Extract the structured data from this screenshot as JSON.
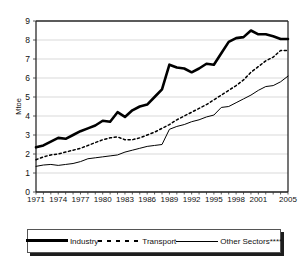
{
  "chart_data": {
    "type": "line",
    "title": "",
    "xlabel": "",
    "ylabel": "Mtoe",
    "ylim": [
      0,
      9
    ],
    "xlim": [
      1971,
      2005
    ],
    "grid": true,
    "legend_position": "bottom",
    "ytick_labels": [
      "0",
      "1",
      "2",
      "3",
      "4",
      "5",
      "6",
      "7",
      "8",
      "9"
    ],
    "ytick_values": [
      0,
      1,
      2,
      3,
      4,
      5,
      6,
      7,
      8,
      9
    ],
    "xtick_labels": [
      "1971",
      "1974",
      "1977",
      "1980",
      "1983",
      "1986",
      "1989",
      "1992",
      "1995",
      "1998",
      "2001",
      "2005"
    ],
    "xtick_values": [
      1971,
      1974,
      1977,
      1980,
      1983,
      1986,
      1989,
      1992,
      1995,
      1998,
      2001,
      2005
    ],
    "x": [
      1971,
      1972,
      1973,
      1974,
      1975,
      1976,
      1977,
      1978,
      1979,
      1980,
      1981,
      1982,
      1983,
      1984,
      1985,
      1986,
      1987,
      1988,
      1989,
      1990,
      1991,
      1992,
      1993,
      1994,
      1995,
      1996,
      1997,
      1998,
      1999,
      2000,
      2001,
      2002,
      2003,
      2004,
      2005
    ],
    "series": [
      {
        "name": "Industry",
        "style": "thick-solid",
        "color": "#000000",
        "values": [
          2.35,
          2.45,
          2.65,
          2.85,
          2.8,
          3.0,
          3.2,
          3.35,
          3.5,
          3.75,
          3.7,
          4.2,
          3.95,
          4.3,
          4.5,
          4.6,
          5.0,
          5.4,
          6.7,
          6.55,
          6.5,
          6.3,
          6.5,
          6.75,
          6.7,
          7.3,
          7.9,
          8.1,
          8.15,
          8.5,
          8.3,
          8.3,
          8.2,
          8.05,
          8.05
        ]
      },
      {
        "name": "Transport",
        "style": "dotted",
        "color": "#000000",
        "values": [
          1.7,
          1.85,
          1.95,
          2.0,
          2.1,
          2.2,
          2.3,
          2.45,
          2.6,
          2.75,
          2.85,
          2.9,
          2.75,
          2.75,
          2.85,
          3.0,
          3.15,
          3.35,
          3.55,
          3.8,
          4.0,
          4.2,
          4.4,
          4.6,
          4.85,
          5.1,
          5.35,
          5.6,
          5.9,
          6.3,
          6.6,
          6.9,
          7.1,
          7.45,
          7.45
        ]
      },
      {
        "name": "Other Sectors****",
        "style": "thin-solid",
        "color": "#000000",
        "values": [
          1.35,
          1.42,
          1.45,
          1.4,
          1.45,
          1.5,
          1.6,
          1.75,
          1.8,
          1.85,
          1.9,
          1.95,
          2.1,
          2.2,
          2.3,
          2.4,
          2.45,
          2.5,
          3.3,
          3.45,
          3.55,
          3.7,
          3.8,
          3.95,
          4.05,
          4.45,
          4.5,
          4.7,
          4.9,
          5.1,
          5.35,
          5.55,
          5.6,
          5.8,
          6.1
        ]
      }
    ]
  },
  "legend": {
    "items": [
      {
        "label": "Industry",
        "swatch": "thick-solid-swatch"
      },
      {
        "label": "Transport",
        "swatch": "dotted-swatch"
      },
      {
        "label": "Other Sectors****",
        "swatch": "thin-solid-swatch"
      }
    ]
  }
}
